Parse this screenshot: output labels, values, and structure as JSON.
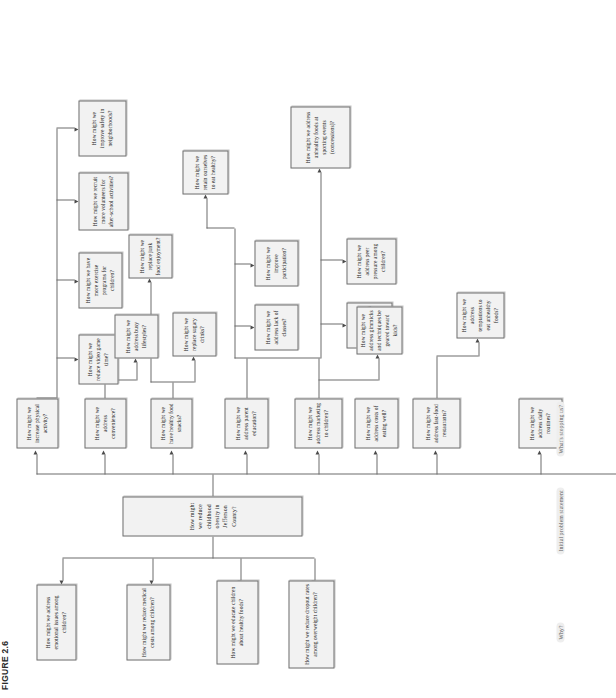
{
  "figure": {
    "caption": "FIGURE 2.6"
  },
  "labels": {
    "why": "Why?",
    "initial": "Initial problem statement",
    "stopping": "What's stopping us?"
  },
  "diagram": {
    "type": "flowchart",
    "root": {
      "id": "root",
      "text": "How might we reduce childhood obesity in Jefferson County?"
    },
    "why_branch": [
      {
        "id": "why1",
        "text": "How might we address emotional issues among children?"
      },
      {
        "id": "why2",
        "text": "How might we reduce medical costs among children?"
      },
      {
        "id": "why3",
        "text": "How might we educate children about healthy foods?"
      },
      {
        "id": "why4",
        "text": "How might we reduce dropout rates among overweight children?"
      }
    ],
    "stopping_branch": [
      {
        "id": "s1",
        "text": "How might we increase physical activity?"
      },
      {
        "id": "s2",
        "text": "How might we address convenience?"
      },
      {
        "id": "s3",
        "text": "How might we have healthy food snacks?"
      },
      {
        "id": "s4",
        "text": "How might we address parent education?"
      },
      {
        "id": "s5",
        "text": "How might we address marketing to children?"
      },
      {
        "id": "s6",
        "text": "How might we address costs of eating well?"
      },
      {
        "id": "s7",
        "text": "How might we address fast-food restaurants?"
      },
      {
        "id": "s8",
        "text": "How might we address daily routines?"
      }
    ],
    "leaves": [
      {
        "id": "l1",
        "text": "How might we reduce video game time?"
      },
      {
        "id": "l2",
        "text": "How might we have more exercise programs for children?"
      },
      {
        "id": "l3",
        "text": "How might we recruit more volunteers for after-school activities?"
      },
      {
        "id": "l4",
        "text": "How might we improve safety in neighborhoods?"
      },
      {
        "id": "l5",
        "text": "How might we address busy lifestyles?"
      },
      {
        "id": "l6",
        "text": "How might we replace junk food enjoyment?"
      },
      {
        "id": "l7",
        "text": "How might we replace sugary drinks?"
      },
      {
        "id": "l8",
        "text": "How might we retain ourselves to eat healthy?"
      },
      {
        "id": "l9",
        "text": "How might we address lack of classes?"
      },
      {
        "id": "l10",
        "text": "How might we improve participation?"
      },
      {
        "id": "l11",
        "text": "How might we address unhealthy foods at sporting events (concessions)?"
      },
      {
        "id": "l12",
        "text": "How might we address programs in school?"
      },
      {
        "id": "l13",
        "text": "How might we address peer pressure among children?"
      },
      {
        "id": "l14",
        "text": "How might we address gimmicks and techniques be geared toward kids?"
      },
      {
        "id": "l15",
        "text": "How might we address temptations to eat unhealthy foods?"
      }
    ]
  },
  "colors": {
    "box_fill": "#f2f2f2",
    "box_border": "#6f6f6f",
    "line": "#6d6d6d",
    "text": "#1a1a1a",
    "label_text": "#5a5a5a"
  }
}
